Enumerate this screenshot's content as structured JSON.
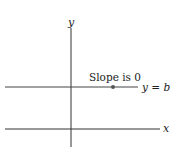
{
  "diagram": {
    "axes": {
      "x_label": "x",
      "y_label": "y"
    },
    "line": {
      "label": "y = b",
      "annotation": "Slope is 0"
    },
    "colors": {
      "axis": "#333333",
      "line": "#555555",
      "point": "#555555"
    }
  }
}
